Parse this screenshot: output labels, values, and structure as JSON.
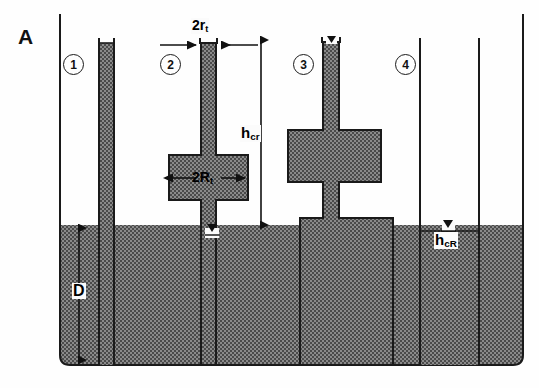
{
  "figure": {
    "panel_label": "A",
    "type": "capillary-rise-schematic",
    "caption_text": ""
  },
  "tubes": [
    {
      "id": "1",
      "number_label": "1",
      "description": "uniform narrow capillary, fully filled to top"
    },
    {
      "id": "2",
      "number_label": "2",
      "description": "narrow capillary with mid-height wide bulge chamber"
    },
    {
      "id": "3",
      "number_label": "3",
      "description": "narrow capillary with bulge chamber and wide base block"
    },
    {
      "id": "4",
      "number_label": "4",
      "description": "wide open tube, low meniscus rise"
    }
  ],
  "dimensions": {
    "tube_radius": {
      "text": "2r",
      "sub": "t"
    },
    "chamber_radius": {
      "text": "2R",
      "sub": "t"
    },
    "critical_height": {
      "text": "h",
      "sub": "cr"
    },
    "critical_height_R": {
      "text": "h",
      "sub": "cR"
    },
    "depth": {
      "text": "D",
      "sub": ""
    }
  },
  "colors": {
    "water_fill": "#6e6e6e",
    "outline": "#1a1a1a",
    "background": "#fefefe",
    "label_text": "#111111"
  }
}
